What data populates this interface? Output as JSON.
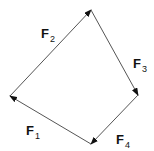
{
  "diagram": {
    "vertices": {
      "A": [
        10,
        96
      ],
      "B": [
        91,
        10
      ],
      "C": [
        138,
        95
      ],
      "D": [
        91,
        144
      ]
    },
    "vectors": [
      {
        "id": "F2",
        "letter": "F",
        "subscript": "2",
        "from": "A",
        "to": "B",
        "label_pos": [
          41,
          38
        ]
      },
      {
        "id": "F3",
        "letter": "F",
        "subscript": "3",
        "from": "B",
        "to": "C",
        "label_pos": [
          133,
          68
        ]
      },
      {
        "id": "F4",
        "letter": "F",
        "subscript": "4",
        "from": "C",
        "to": "D",
        "label_pos": [
          116,
          144
        ]
      },
      {
        "id": "F1",
        "letter": "F",
        "subscript": "1",
        "from": "D",
        "to": "A",
        "label_pos": [
          26,
          135
        ]
      }
    ],
    "colors": {
      "line": "#555555",
      "arrowhead": "#111111",
      "text": "#111111"
    }
  }
}
